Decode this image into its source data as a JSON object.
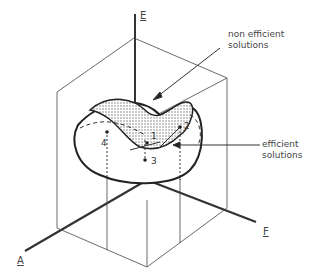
{
  "axes": {
    "E": "E",
    "A": "A",
    "F": "F"
  },
  "labels": {
    "non_efficient": [
      "non efficient",
      "solutions"
    ],
    "efficient": [
      "efficient",
      "solutions"
    ]
  },
  "points": [
    "1",
    "2",
    "3",
    "4"
  ],
  "colors": {
    "line": "#333333",
    "shade": "#888888",
    "background": "#ffffff"
  }
}
